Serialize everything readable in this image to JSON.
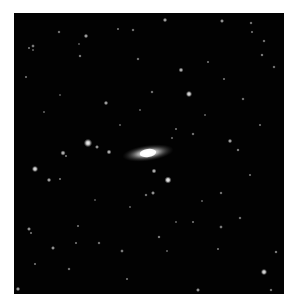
{
  "image": {
    "frame": {
      "x": 14,
      "y": 13,
      "width": 270,
      "height": 281,
      "background": "#020202"
    },
    "galaxy": {
      "cx": 148,
      "cy": 153,
      "rx": 26,
      "ry": 8,
      "rotation": -8,
      "core_color": "#ffffff",
      "halo_color": "#9a9a9a"
    },
    "stars": [
      {
        "x": 88,
        "y": 143,
        "r": 2.4,
        "b": 1.0
      },
      {
        "x": 97,
        "y": 147,
        "r": 1.2,
        "b": 0.7
      },
      {
        "x": 109,
        "y": 152,
        "r": 1.4,
        "b": 0.8
      },
      {
        "x": 63,
        "y": 153,
        "r": 1.5,
        "b": 0.8
      },
      {
        "x": 66,
        "y": 156,
        "r": 0.9,
        "b": 0.5
      },
      {
        "x": 35,
        "y": 169,
        "r": 1.8,
        "b": 0.95
      },
      {
        "x": 49,
        "y": 180,
        "r": 1.3,
        "b": 0.75
      },
      {
        "x": 60,
        "y": 179,
        "r": 0.9,
        "b": 0.5
      },
      {
        "x": 189,
        "y": 94,
        "r": 1.8,
        "b": 0.95
      },
      {
        "x": 154,
        "y": 171,
        "r": 1.4,
        "b": 0.8
      },
      {
        "x": 168,
        "y": 180,
        "r": 2.0,
        "b": 1.0
      },
      {
        "x": 230,
        "y": 141,
        "r": 1.3,
        "b": 0.75
      },
      {
        "x": 238,
        "y": 150,
        "r": 1.0,
        "b": 0.6
      },
      {
        "x": 193,
        "y": 134,
        "r": 1.0,
        "b": 0.55
      },
      {
        "x": 152,
        "y": 92,
        "r": 1.0,
        "b": 0.55
      },
      {
        "x": 243,
        "y": 99,
        "r": 1.0,
        "b": 0.55
      },
      {
        "x": 176,
        "y": 129,
        "r": 0.9,
        "b": 0.5
      },
      {
        "x": 172,
        "y": 138,
        "r": 0.9,
        "b": 0.45
      },
      {
        "x": 86,
        "y": 36,
        "r": 1.3,
        "b": 0.75
      },
      {
        "x": 80,
        "y": 56,
        "r": 1.0,
        "b": 0.6
      },
      {
        "x": 33,
        "y": 46,
        "r": 1.1,
        "b": 0.6
      },
      {
        "x": 29,
        "y": 48,
        "r": 0.9,
        "b": 0.5
      },
      {
        "x": 33,
        "y": 50,
        "r": 0.8,
        "b": 0.45
      },
      {
        "x": 59,
        "y": 32,
        "r": 1.0,
        "b": 0.55
      },
      {
        "x": 106,
        "y": 103,
        "r": 1.3,
        "b": 0.75
      },
      {
        "x": 133,
        "y": 30,
        "r": 1.0,
        "b": 0.55
      },
      {
        "x": 118,
        "y": 29,
        "r": 0.9,
        "b": 0.5
      },
      {
        "x": 138,
        "y": 59,
        "r": 1.0,
        "b": 0.55
      },
      {
        "x": 26,
        "y": 77,
        "r": 0.9,
        "b": 0.5
      },
      {
        "x": 79,
        "y": 44,
        "r": 0.8,
        "b": 0.4
      },
      {
        "x": 165,
        "y": 20,
        "r": 1.3,
        "b": 0.75
      },
      {
        "x": 222,
        "y": 21,
        "r": 1.2,
        "b": 0.7
      },
      {
        "x": 251,
        "y": 23,
        "r": 1.0,
        "b": 0.55
      },
      {
        "x": 264,
        "y": 41,
        "r": 1.0,
        "b": 0.55
      },
      {
        "x": 181,
        "y": 70,
        "r": 1.4,
        "b": 0.8
      },
      {
        "x": 274,
        "y": 67,
        "r": 1.0,
        "b": 0.55
      },
      {
        "x": 208,
        "y": 62,
        "r": 0.9,
        "b": 0.5
      },
      {
        "x": 252,
        "y": 32,
        "r": 0.9,
        "b": 0.5
      },
      {
        "x": 262,
        "y": 55,
        "r": 1.0,
        "b": 0.6
      },
      {
        "x": 224,
        "y": 79,
        "r": 0.9,
        "b": 0.5
      },
      {
        "x": 53,
        "y": 248,
        "r": 1.2,
        "b": 0.7
      },
      {
        "x": 76,
        "y": 243,
        "r": 0.9,
        "b": 0.5
      },
      {
        "x": 99,
        "y": 243,
        "r": 1.0,
        "b": 0.55
      },
      {
        "x": 122,
        "y": 251,
        "r": 1.1,
        "b": 0.6
      },
      {
        "x": 29,
        "y": 229,
        "r": 1.2,
        "b": 0.7
      },
      {
        "x": 31,
        "y": 233,
        "r": 0.9,
        "b": 0.5
      },
      {
        "x": 18,
        "y": 289,
        "r": 1.3,
        "b": 0.75
      },
      {
        "x": 35,
        "y": 264,
        "r": 0.9,
        "b": 0.5
      },
      {
        "x": 127,
        "y": 279,
        "r": 0.9,
        "b": 0.5
      },
      {
        "x": 69,
        "y": 269,
        "r": 1.0,
        "b": 0.55
      },
      {
        "x": 146,
        "y": 195,
        "r": 1.0,
        "b": 0.55
      },
      {
        "x": 130,
        "y": 207,
        "r": 0.8,
        "b": 0.45
      },
      {
        "x": 78,
        "y": 226,
        "r": 0.9,
        "b": 0.5
      },
      {
        "x": 153,
        "y": 193,
        "r": 1.2,
        "b": 0.7
      },
      {
        "x": 221,
        "y": 193,
        "r": 1.0,
        "b": 0.55
      },
      {
        "x": 221,
        "y": 227,
        "r": 1.1,
        "b": 0.6
      },
      {
        "x": 264,
        "y": 272,
        "r": 1.8,
        "b": 0.95
      },
      {
        "x": 276,
        "y": 252,
        "r": 1.0,
        "b": 0.6
      },
      {
        "x": 159,
        "y": 237,
        "r": 1.0,
        "b": 0.6
      },
      {
        "x": 198,
        "y": 290,
        "r": 1.2,
        "b": 0.7
      },
      {
        "x": 193,
        "y": 222,
        "r": 0.9,
        "b": 0.5
      },
      {
        "x": 271,
        "y": 290,
        "r": 1.0,
        "b": 0.55
      },
      {
        "x": 176,
        "y": 222,
        "r": 0.8,
        "b": 0.45
      },
      {
        "x": 240,
        "y": 218,
        "r": 1.0,
        "b": 0.55
      },
      {
        "x": 202,
        "y": 201,
        "r": 0.8,
        "b": 0.45
      },
      {
        "x": 167,
        "y": 251,
        "r": 0.8,
        "b": 0.45
      },
      {
        "x": 218,
        "y": 249,
        "r": 0.9,
        "b": 0.5
      },
      {
        "x": 44,
        "y": 112,
        "r": 0.8,
        "b": 0.45
      },
      {
        "x": 120,
        "y": 125,
        "r": 0.8,
        "b": 0.45
      },
      {
        "x": 95,
        "y": 200,
        "r": 0.8,
        "b": 0.4
      },
      {
        "x": 250,
        "y": 175,
        "r": 0.9,
        "b": 0.5
      },
      {
        "x": 260,
        "y": 125,
        "r": 0.9,
        "b": 0.5
      },
      {
        "x": 205,
        "y": 115,
        "r": 0.8,
        "b": 0.45
      },
      {
        "x": 60,
        "y": 95,
        "r": 0.8,
        "b": 0.4
      },
      {
        "x": 140,
        "y": 110,
        "r": 0.8,
        "b": 0.45
      }
    ]
  }
}
